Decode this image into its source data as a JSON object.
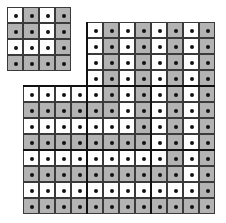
{
  "figure": {
    "cell_size_px": 16,
    "colors": {
      "white": "#ffffff",
      "gray": "#b3b3b3",
      "line": "#3a3a3a",
      "dot": "#111111"
    },
    "small_grid": {
      "rows": 4,
      "cols": 4,
      "pattern": [
        "WGWG",
        "GGWG",
        "WWWG",
        "GGGG"
      ]
    },
    "large_grid": {
      "rows": 12,
      "cols": 12,
      "note": "top 4 rows occupy only columns 5-12",
      "pattern": [
        "....WGWGWGWG",
        "....WGWGWGWG",
        "....WGWGWGWG",
        "....WGWGWGWG",
        "WWWWWGWGWGWG",
        "GGGGGGWGWGWG",
        "WWWWWWWGWGWG",
        "GGGGGGGGWGWG",
        "WWWWWWWWWGWG",
        "GGGGGGGGGGWG",
        "WWWWWWWWWWWG",
        "GGGGGGGGGGGG"
      ]
    },
    "caption": ""
  }
}
